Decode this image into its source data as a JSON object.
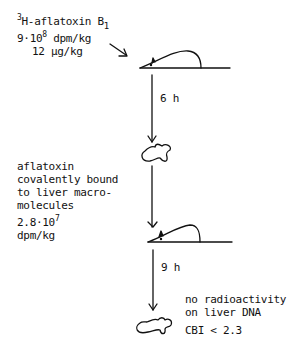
{
  "input": {
    "isotope_sup": "3",
    "compound": "H-aflatoxin B",
    "compound_sub": "1",
    "dose_activity_base": "9·10",
    "dose_activity_exp": "8",
    "dose_activity_unit": " dpm/kg",
    "dose_mass": "12 µg/kg"
  },
  "step1": {
    "interval": "6 h"
  },
  "bound": {
    "line1": "aflatoxin",
    "line2": "covalently bound",
    "line3": "to liver macro-",
    "line4": "molecules",
    "value_base": "2.8·10",
    "value_exp": "7",
    "unit": "dpm/kg"
  },
  "step2": {
    "interval": "9 h"
  },
  "result": {
    "line1": "no radioactivity",
    "line2": "on liver DNA",
    "cbi": "CBI < 2.3"
  },
  "icons": [
    "rat-icon",
    "liver-icon",
    "rat-icon",
    "liver-icon",
    "arrow-down-icon"
  ]
}
